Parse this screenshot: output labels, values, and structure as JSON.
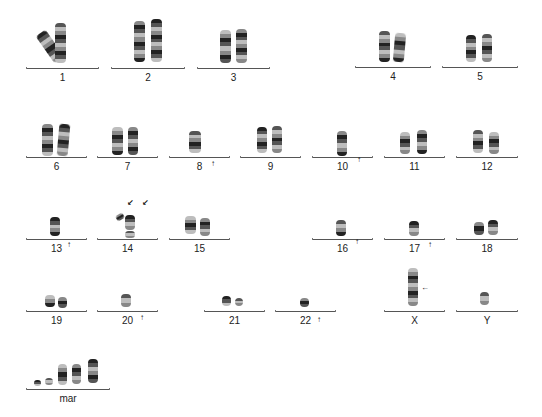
{
  "figure": {
    "type": "karyotype",
    "colors": {
      "background": "#ffffff",
      "line": "#555555",
      "band_dark": "#222222",
      "band_light": "#bdbdbd",
      "arrow": "#111111"
    },
    "groups": [
      {
        "label": "1",
        "line": [
          26,
          99,
          68
        ],
        "label_y": 73,
        "chroms": [
          {
            "x": 44,
            "y": 30,
            "w": 12,
            "h": 33,
            "rot": -35
          },
          {
            "x": 55,
            "y": 23,
            "w": 11,
            "h": 40,
            "rot": 0
          }
        ],
        "arrows": []
      },
      {
        "label": "2",
        "line": [
          111,
          185,
          68
        ],
        "label_y": 73,
        "chroms": [
          {
            "x": 134,
            "y": 21,
            "w": 11,
            "h": 41,
            "rot": 0
          },
          {
            "x": 151,
            "y": 19,
            "w": 11,
            "h": 43,
            "rot": 0
          }
        ],
        "arrows": []
      },
      {
        "label": "3",
        "line": [
          197,
          270,
          68
        ],
        "label_y": 73,
        "chroms": [
          {
            "x": 220,
            "y": 30,
            "w": 11,
            "h": 33,
            "rot": 0
          },
          {
            "x": 236,
            "y": 29,
            "w": 11,
            "h": 34,
            "rot": 0
          }
        ],
        "arrows": []
      },
      {
        "label": "4",
        "line": [
          355,
          431,
          67
        ],
        "label_y": 72,
        "chroms": [
          {
            "x": 379,
            "y": 31,
            "w": 11,
            "h": 31,
            "rot": 0
          },
          {
            "x": 394,
            "y": 33,
            "w": 11,
            "h": 29,
            "rot": 5
          }
        ],
        "arrows": []
      },
      {
        "label": "5",
        "line": [
          442,
          518,
          67
        ],
        "label_y": 72,
        "chroms": [
          {
            "x": 466,
            "y": 35,
            "w": 10,
            "h": 27,
            "rot": 0
          },
          {
            "x": 482,
            "y": 34,
            "w": 10,
            "h": 28,
            "rot": 0
          }
        ],
        "arrows": []
      },
      {
        "label": "6",
        "line": [
          26,
          87,
          157
        ],
        "label_y": 162,
        "chroms": [
          {
            "x": 42,
            "y": 124,
            "w": 11,
            "h": 32,
            "rot": 0
          },
          {
            "x": 58,
            "y": 124,
            "w": 11,
            "h": 32,
            "rot": 5
          }
        ],
        "arrows": []
      },
      {
        "label": "7",
        "line": [
          97,
          158,
          157
        ],
        "label_y": 162,
        "chroms": [
          {
            "x": 112,
            "y": 127,
            "w": 11,
            "h": 28,
            "rot": 0
          },
          {
            "x": 128,
            "y": 127,
            "w": 10,
            "h": 28,
            "rot": 0
          }
        ],
        "arrows": []
      },
      {
        "label": "8",
        "line": [
          169,
          230,
          157
        ],
        "label_y": 162,
        "chroms": [
          {
            "x": 189,
            "y": 131,
            "w": 12,
            "h": 22,
            "rot": 0
          }
        ],
        "arrows": [
          {
            "x": 214,
            "y": 164,
            "dir": "up"
          }
        ]
      },
      {
        "label": "9",
        "line": [
          240,
          301,
          157
        ],
        "label_y": 162,
        "chroms": [
          {
            "x": 257,
            "y": 127,
            "w": 10,
            "h": 26,
            "rot": 0
          },
          {
            "x": 272,
            "y": 126,
            "w": 10,
            "h": 27,
            "rot": 0
          }
        ],
        "arrows": []
      },
      {
        "label": "10",
        "line": [
          312,
          373,
          157
        ],
        "label_y": 162,
        "chroms": [
          {
            "x": 337,
            "y": 131,
            "w": 10,
            "h": 25,
            "rot": 0
          }
        ],
        "arrows": [
          {
            "x": 360,
            "y": 160,
            "dir": "up"
          }
        ]
      },
      {
        "label": "11",
        "line": [
          384,
          445,
          157
        ],
        "label_y": 162,
        "chroms": [
          {
            "x": 400,
            "y": 132,
            "w": 10,
            "h": 22,
            "rot": 0
          },
          {
            "x": 417,
            "y": 130,
            "w": 10,
            "h": 24,
            "rot": 0
          }
        ],
        "arrows": []
      },
      {
        "label": "12",
        "line": [
          456,
          518,
          157
        ],
        "label_y": 162,
        "chroms": [
          {
            "x": 473,
            "y": 130,
            "w": 10,
            "h": 23,
            "rot": 0
          },
          {
            "x": 489,
            "y": 132,
            "w": 10,
            "h": 22,
            "rot": 0
          }
        ],
        "arrows": []
      },
      {
        "label": "13",
        "line": [
          26,
          87,
          239
        ],
        "label_y": 244,
        "chroms": [
          {
            "x": 50,
            "y": 217,
            "w": 10,
            "h": 19,
            "rot": 0
          }
        ],
        "arrows": [
          {
            "x": 70,
            "y": 245,
            "dir": "up"
          }
        ]
      },
      {
        "label": "14",
        "line": [
          97,
          158,
          239
        ],
        "label_y": 244,
        "chroms": [
          {
            "x": 116,
            "y": 214,
            "w": 8,
            "h": 6,
            "rot": -30
          },
          {
            "x": 125,
            "y": 215,
            "w": 10,
            "h": 15,
            "rot": 0
          },
          {
            "x": 125,
            "y": 231,
            "w": 10,
            "h": 7,
            "rot": 0
          }
        ],
        "arrows": [
          {
            "x": 130,
            "y": 203,
            "dir": "down-left"
          },
          {
            "x": 145,
            "y": 203,
            "dir": "down-left"
          }
        ]
      },
      {
        "label": "15",
        "line": [
          169,
          230,
          239
        ],
        "label_y": 244,
        "chroms": [
          {
            "x": 185,
            "y": 216,
            "w": 11,
            "h": 18,
            "rot": 0
          },
          {
            "x": 200,
            "y": 218,
            "w": 10,
            "h": 18,
            "rot": 0
          }
        ],
        "arrows": []
      },
      {
        "label": "16",
        "line": [
          312,
          373,
          239
        ],
        "label_y": 244,
        "chroms": [
          {
            "x": 336,
            "y": 220,
            "w": 10,
            "h": 16,
            "rot": 0
          }
        ],
        "arrows": [
          {
            "x": 358,
            "y": 242,
            "dir": "up"
          }
        ]
      },
      {
        "label": "17",
        "line": [
          384,
          445,
          239
        ],
        "label_y": 244,
        "chroms": [
          {
            "x": 409,
            "y": 221,
            "w": 10,
            "h": 15,
            "rot": 0
          }
        ],
        "arrows": [
          {
            "x": 431,
            "y": 245,
            "dir": "up"
          }
        ]
      },
      {
        "label": "18",
        "line": [
          456,
          518,
          239
        ],
        "label_y": 244,
        "chroms": [
          {
            "x": 474,
            "y": 222,
            "w": 10,
            "h": 13,
            "rot": 0
          },
          {
            "x": 488,
            "y": 220,
            "w": 10,
            "h": 15,
            "rot": 0
          }
        ],
        "arrows": []
      },
      {
        "label": "19",
        "line": [
          26,
          87,
          311
        ],
        "label_y": 316,
        "chroms": [
          {
            "x": 45,
            "y": 295,
            "w": 10,
            "h": 12,
            "rot": 0
          },
          {
            "x": 58,
            "y": 297,
            "w": 9,
            "h": 11,
            "rot": 0
          }
        ],
        "arrows": []
      },
      {
        "label": "20",
        "line": [
          97,
          158,
          311
        ],
        "label_y": 316,
        "chroms": [
          {
            "x": 121,
            "y": 294,
            "w": 10,
            "h": 13,
            "rot": 0
          }
        ],
        "arrows": [
          {
            "x": 143,
            "y": 318,
            "dir": "up"
          }
        ]
      },
      {
        "label": "21",
        "line": [
          204,
          265,
          311
        ],
        "label_y": 316,
        "chroms": [
          {
            "x": 222,
            "y": 296,
            "w": 9,
            "h": 10,
            "rot": 0
          },
          {
            "x": 235,
            "y": 298,
            "w": 8,
            "h": 8,
            "rot": 0
          }
        ],
        "arrows": []
      },
      {
        "label": "22",
        "line": [
          275,
          336,
          311
        ],
        "label_y": 316,
        "chroms": [
          {
            "x": 300,
            "y": 298,
            "w": 9,
            "h": 9,
            "rot": 0
          }
        ],
        "arrows": [
          {
            "x": 320,
            "y": 320,
            "dir": "up"
          }
        ]
      },
      {
        "label": "X",
        "line": [
          384,
          445,
          311
        ],
        "label_y": 316,
        "chroms": [
          {
            "x": 408,
            "y": 268,
            "w": 10,
            "h": 38,
            "rot": 0
          }
        ],
        "arrows": [
          {
            "x": 424,
            "y": 288,
            "dir": "left"
          }
        ]
      },
      {
        "label": "Y",
        "line": [
          456,
          518,
          311
        ],
        "label_y": 316,
        "chroms": [
          {
            "x": 480,
            "y": 292,
            "w": 9,
            "h": 13,
            "rot": 0
          }
        ],
        "arrows": []
      },
      {
        "label": "mar",
        "line": [
          26,
          110,
          389
        ],
        "label_y": 394,
        "chroms": [
          {
            "x": 34,
            "y": 380,
            "w": 7,
            "h": 6,
            "rot": 0
          },
          {
            "x": 45,
            "y": 378,
            "w": 8,
            "h": 7,
            "rot": 0
          },
          {
            "x": 58,
            "y": 364,
            "w": 9,
            "h": 21,
            "rot": 0
          },
          {
            "x": 72,
            "y": 364,
            "w": 9,
            "h": 20,
            "rot": 0
          },
          {
            "x": 88,
            "y": 359,
            "w": 10,
            "h": 24,
            "rot": 0
          }
        ],
        "arrows": []
      }
    ]
  }
}
